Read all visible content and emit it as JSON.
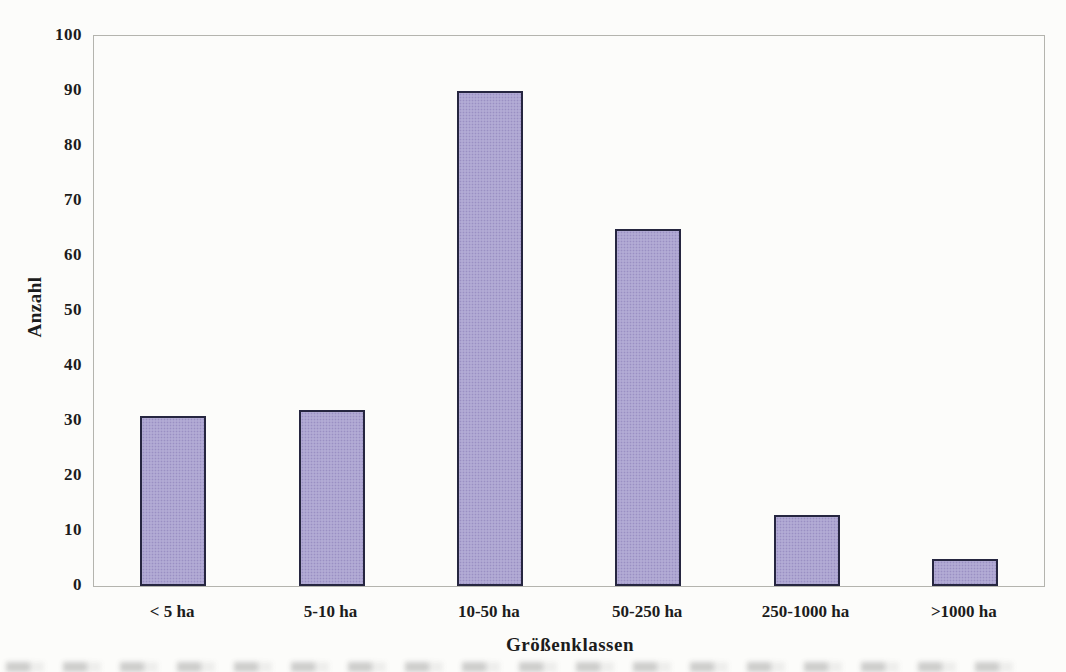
{
  "chart_data": {
    "type": "bar",
    "title": "",
    "categories": [
      "< 5 ha",
      "5-10 ha",
      "10-50 ha",
      "50-250 ha",
      "250-1000 ha",
      ">1000 ha"
    ],
    "values": [
      31,
      32,
      90,
      65,
      13,
      5
    ],
    "xlabel": "Größenklassen",
    "ylabel": "Anzahl",
    "ylim": [
      0,
      100
    ],
    "yticks": [
      0,
      10,
      20,
      30,
      40,
      50,
      60,
      70,
      80,
      90,
      100
    ],
    "grid": false,
    "legend": "none",
    "colors": {
      "bar_fill": "#aba3d0",
      "bar_dot": "#9a90c2",
      "bar_border": "#262640",
      "axis": "#b4b4ae",
      "text": "#1c1c1c",
      "background": "#fcfcfa"
    }
  }
}
